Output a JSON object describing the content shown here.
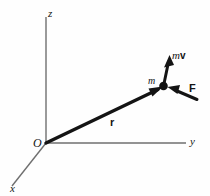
{
  "figure": {
    "kind": "physics-vector-diagram",
    "background_color": "#fefefe",
    "ink_color": "#141414",
    "axis_color": "#6f6f6f"
  },
  "axes": {
    "z": {
      "label": "z",
      "from": [
        46,
        143
      ],
      "to": [
        46,
        17
      ]
    },
    "y": {
      "label": "y",
      "from": [
        46,
        143
      ],
      "to": [
        186,
        143
      ]
    },
    "x": {
      "label": "x",
      "from": [
        46,
        143
      ],
      "to": [
        12,
        186
      ]
    }
  },
  "origin": {
    "label": "O",
    "at": [
      46,
      143
    ]
  },
  "particle": {
    "mass_label": "m",
    "at": [
      163,
      86
    ],
    "radius": 4.2,
    "color": "#111111"
  },
  "vectors": [
    {
      "name": "position",
      "label": "r",
      "style": "bold",
      "from": [
        46,
        143
      ],
      "to": [
        161,
        88
      ],
      "stroke_width": 3.4
    },
    {
      "name": "momentum",
      "label": "mv",
      "label_mass": "m",
      "label_velocity": "v",
      "style": "bold",
      "from": [
        163,
        86
      ],
      "to": [
        169,
        56
      ],
      "stroke_width": 3.0
    },
    {
      "name": "force",
      "label": "F",
      "style": "bold",
      "from": [
        196,
        99
      ],
      "to": [
        168,
        87
      ],
      "stroke_width": 3.0
    }
  ]
}
